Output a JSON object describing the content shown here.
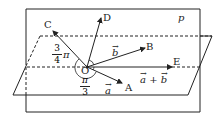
{
  "plane_label": "p",
  "points": {
    "O": "O",
    "A": "A",
    "B": "B",
    "C": "C",
    "D": "D",
    "E": "E"
  },
  "vectors": {
    "a": "a",
    "b": "b",
    "a_plus_b": "a + b",
    "arrow": "→"
  },
  "angles": {
    "angle_COA": {
      "numerator": "3",
      "denominator": "4",
      "suffix": "π"
    },
    "angle_AOE": {
      "numerator": "π",
      "denominator": "3"
    }
  },
  "colors": {
    "stroke": "#222222",
    "background": "#ffffff"
  }
}
